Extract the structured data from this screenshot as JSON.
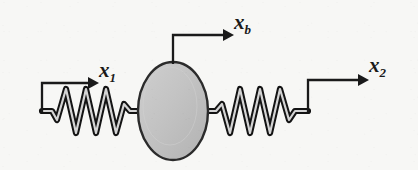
{
  "figure": {
    "background_color": "#f7f7f5",
    "line_color": "#1a1a1a",
    "mass_fill_color": "#c2c2c2",
    "mass_edge_color": "#2b2b2b",
    "spring_highlight_color": "#d8d8d8"
  },
  "labels": {
    "x1": {
      "base": "x",
      "sub": "1"
    },
    "xb": {
      "base": "x",
      "sub": "b"
    },
    "x2": {
      "base": "x",
      "sub": "2"
    }
  },
  "elements": {
    "mass": {
      "name": "mass-body",
      "shape": "ellipse",
      "center_x": 173,
      "center_y": 111,
      "radius_x": 35,
      "radius_y": 49
    },
    "left_spring": {
      "name": "left-spring",
      "coils": 5,
      "x_start": 42,
      "x_end": 138,
      "baseline_y": 111,
      "amplitude": 22
    },
    "right_spring": {
      "name": "right-spring",
      "coils": 5,
      "x_start": 208,
      "x_end": 308,
      "baseline_y": 111,
      "amplitude": 22
    },
    "arrow_x1": {
      "name": "displacement-arrow-x1",
      "anchor_x": 42,
      "anchor_y": 111,
      "stem_y": 83,
      "tip_x": 97
    },
    "arrow_xb": {
      "name": "displacement-arrow-xb",
      "anchor_x": 173,
      "anchor_y": 62,
      "stem_y": 35,
      "tip_x": 232
    },
    "arrow_x2": {
      "name": "displacement-arrow-x2",
      "anchor_x": 308,
      "anchor_y": 111,
      "stem_y": 80,
      "tip_x": 367
    }
  }
}
